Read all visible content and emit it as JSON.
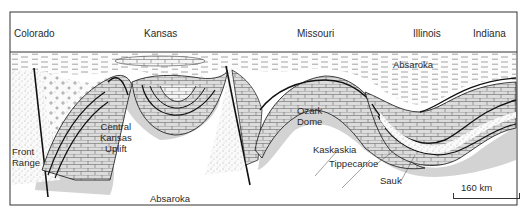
{
  "figure": {
    "type": "geologic-cross-section",
    "states": [
      "Colorado",
      "Kansas",
      "Missouri",
      "Illinois",
      "Indiana"
    ],
    "structures": {
      "front_range": "Front\nRange",
      "central_kansas_uplift": [
        "Central",
        "Kansas",
        "Uplift"
      ],
      "ozark_dome": [
        "Ozark",
        "Dome"
      ]
    },
    "sequences": {
      "absaroka_top": "Absaroka",
      "absaroka_bottom": "Absaroka",
      "kaskaskia": "Kaskaskia",
      "tippecanoe": "Tippecanoe",
      "sauk": "Sauk"
    },
    "scale": {
      "label": "160 km"
    },
    "colors": {
      "frame": "#333333",
      "ink": "#1a1a1a",
      "limestone_fill": "#d9d9d9",
      "halo": "#cfcfcf",
      "sand": "#ffffff"
    }
  }
}
